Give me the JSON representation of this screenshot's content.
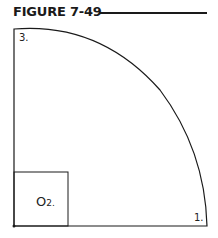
{
  "figure": {
    "title": "FIGURE 7-49",
    "labels": {
      "point3": "3.",
      "point1": "1.",
      "center_letter": "O",
      "center_sub": "2."
    },
    "colors": {
      "ink": "#1a1a1a"
    }
  }
}
